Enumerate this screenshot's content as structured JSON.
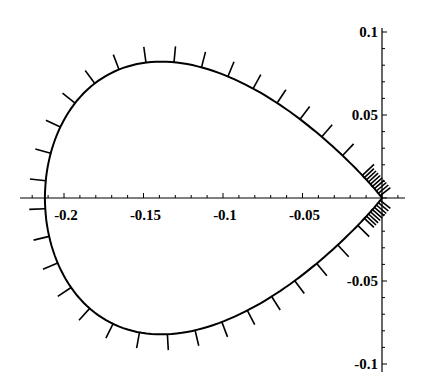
{
  "chart_data": {
    "type": "line",
    "title": "",
    "xlabel": "",
    "ylabel": "",
    "xlim": [
      -0.24,
      0.025
    ],
    "ylim": [
      -0.105,
      0.105
    ],
    "grid": false,
    "legend": null,
    "x_ticks": [
      -0.2,
      -0.15,
      -0.1,
      -0.05
    ],
    "x_tick_labels": [
      "-0.2",
      "-0.15",
      "-0.1",
      "-0.05"
    ],
    "y_ticks": [
      0.1,
      0.05,
      -0.05,
      -0.1
    ],
    "y_tick_labels": [
      "0.1",
      "0.05",
      "-0.05",
      "-0.1"
    ],
    "series": [
      {
        "name": "curve",
        "x": [
          0.0,
          -0.01,
          -0.025,
          -0.045,
          -0.07,
          -0.1,
          -0.13,
          -0.16,
          -0.185,
          -0.203,
          -0.212,
          -0.203,
          -0.185,
          -0.16,
          -0.13,
          -0.1,
          -0.07,
          -0.045,
          -0.025,
          -0.01,
          0.0
        ],
        "y": [
          0.0,
          0.022,
          0.042,
          0.061,
          0.077,
          0.087,
          0.09,
          0.086,
          0.072,
          0.046,
          0.0,
          -0.046,
          -0.072,
          -0.086,
          -0.09,
          -0.087,
          -0.077,
          -0.061,
          -0.042,
          -0.022,
          0.0
        ]
      }
    ]
  },
  "axes": {
    "x_labels": [
      "-0.2",
      "-0.15",
      "-0.1",
      "-0.05"
    ],
    "y_labels": [
      "0.1",
      "0.05",
      "-0.05",
      "-0.1"
    ]
  }
}
